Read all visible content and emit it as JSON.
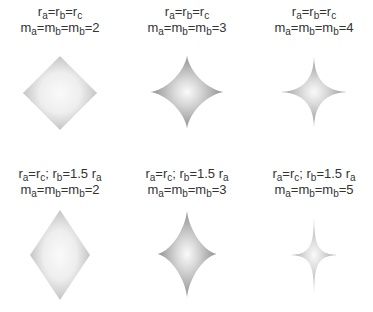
{
  "figure": {
    "panels": [
      {
        "row": 0,
        "col": 0,
        "cx": 60,
        "cy": 93,
        "label_line1": [
          [
            "r",
            "a"
          ],
          [
            "=r",
            "b"
          ],
          [
            "=r",
            "c"
          ]
        ],
        "label_line2": [
          [
            "m",
            "a"
          ],
          [
            "=m",
            "b"
          ],
          [
            "=m",
            "b"
          ],
          [
            "=2",
            ""
          ]
        ],
        "line1_text": "r_a=r_b=r_c",
        "line2_text": "m_a=m_b=m_b=2",
        "ra": 37,
        "rb": 37,
        "m": 2
      },
      {
        "row": 0,
        "col": 1,
        "cx": 187,
        "cy": 92,
        "label_line1": [
          [
            "r",
            "a"
          ],
          [
            "=r",
            "b"
          ],
          [
            "=r",
            "c"
          ]
        ],
        "label_line2": [
          [
            "m",
            "a"
          ],
          [
            "=m",
            "b"
          ],
          [
            "=m",
            "b"
          ],
          [
            "=3",
            ""
          ]
        ],
        "line1_text": "r_a=r_b=r_c",
        "line2_text": "m_a=m_b=m_b=3",
        "ra": 37,
        "rb": 37,
        "m": 3
      },
      {
        "row": 0,
        "col": 2,
        "cx": 314,
        "cy": 92,
        "label_line1": [
          [
            "r",
            "a"
          ],
          [
            "=r",
            "b"
          ],
          [
            "=r",
            "c"
          ]
        ],
        "label_line2": [
          [
            "m",
            "a"
          ],
          [
            "=m",
            "b"
          ],
          [
            "=m",
            "b"
          ],
          [
            "=4",
            ""
          ]
        ],
        "line1_text": "r_a=r_b=r_c",
        "line2_text": "m_a=m_b=m_b=4",
        "ra": 36,
        "rb": 37,
        "m": 4
      },
      {
        "row": 1,
        "col": 0,
        "cx": 60,
        "cy": 255,
        "label_line1": [
          [
            "r",
            "a"
          ],
          [
            "=r",
            "c"
          ],
          [
            "; r",
            "b"
          ],
          [
            "=1.5 r",
            "a"
          ]
        ],
        "label_line2": [
          [
            "m",
            "a"
          ],
          [
            "=m",
            "b"
          ],
          [
            "=m",
            "b"
          ],
          [
            "=2",
            ""
          ]
        ],
        "line1_text": "r_a=r_c; r_b=1.5 r_a",
        "line2_text": "m_a=m_b=m_b=2",
        "ra": 30,
        "rb": 45,
        "m": 2
      },
      {
        "row": 1,
        "col": 1,
        "cx": 187,
        "cy": 254,
        "label_line1": [
          [
            "r",
            "a"
          ],
          [
            "=r",
            "c"
          ],
          [
            "; r",
            "b"
          ],
          [
            "=1.5 r",
            "a"
          ]
        ],
        "label_line2": [
          [
            "m",
            "a"
          ],
          [
            "=m",
            "b"
          ],
          [
            "=m",
            "b"
          ],
          [
            "=3",
            ""
          ]
        ],
        "line1_text": "r_a=r_c; r_b=1.5 r_a",
        "line2_text": "m_a=m_b=m_b=3",
        "ra": 30,
        "rb": 44,
        "m": 3
      },
      {
        "row": 1,
        "col": 2,
        "cx": 314,
        "cy": 255,
        "label_line1": [
          [
            "r",
            "a"
          ],
          [
            "=r",
            "c"
          ],
          [
            "; r",
            "b"
          ],
          [
            "=1.5 r",
            "a"
          ]
        ],
        "label_line2": [
          [
            "m",
            "a"
          ],
          [
            "=m",
            "b"
          ],
          [
            "=m",
            "b"
          ],
          [
            "=5",
            ""
          ]
        ],
        "line1_text": "r_a=r_c; r_b=1.5 r_a",
        "line2_text": "m_a=m_b=m_b=5",
        "ra": 29,
        "rb": 44,
        "m": 5
      }
    ],
    "colors": {
      "text": "#333333",
      "center": "#fafafa",
      "edge_round": "#c4c4c4",
      "edge_sharp": "#8e8e8e"
    }
  }
}
